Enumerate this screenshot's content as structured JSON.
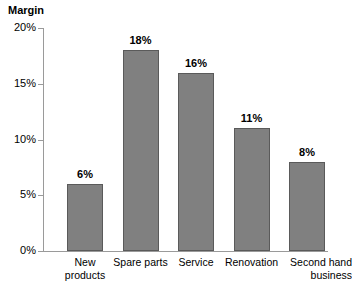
{
  "chart_data": {
    "type": "bar",
    "title": "Margin",
    "xlabel": "",
    "ylabel": "",
    "categories": [
      "New products",
      "Spare parts",
      "Service",
      "Renovation",
      "Second hand business"
    ],
    "values": [
      6,
      18,
      16,
      11,
      8
    ],
    "value_labels": [
      "6%",
      "18%",
      "16%",
      "11%",
      "8%"
    ],
    "ylim": [
      0,
      20
    ],
    "ytick_values": [
      0,
      5,
      10,
      15,
      20
    ],
    "ytick_labels": [
      "0%",
      "5%",
      "10%",
      "15%",
      "20%"
    ],
    "grid": false,
    "legend": null,
    "bar_color": "#808080",
    "bar_edge_color": "#5a5a5a",
    "axis_color": "#9a9a9a",
    "background": "#ffffff",
    "category_lines": [
      [
        "New",
        "products"
      ],
      [
        "Spare parts"
      ],
      [
        "Service"
      ],
      [
        "Renovation"
      ],
      [
        "Second hand",
        "business"
      ]
    ]
  }
}
